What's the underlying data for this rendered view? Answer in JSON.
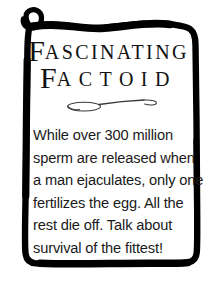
{
  "card": {
    "background_color": "#ffffff",
    "ink_color": "#000000",
    "border_style": "hand-drawn-wavy-frame",
    "corner_ornament": "spiral-curl-top-left"
  },
  "title": {
    "line1": {
      "dropcap": "F",
      "rest": "ASCINATING"
    },
    "line2": {
      "dropcap": "F",
      "rest": "ACTOID"
    },
    "full_text": "FASCINATING FACTOID"
  },
  "divider": {
    "icon": "flourish-ornament-icon",
    "description": "thin horizontal flourish with loop at left"
  },
  "body": {
    "lines": [
      "While over 300 million",
      "sperm are released when",
      "a man ejaculates, only one",
      "fertilizes the egg. All the",
      "rest die off. Talk about",
      "survival of the fittest!"
    ],
    "full_text": "While over 300 million sperm are released when a man ejaculates, only one fertilizes the egg. All the rest die off. Talk about survival of the fittest!"
  }
}
